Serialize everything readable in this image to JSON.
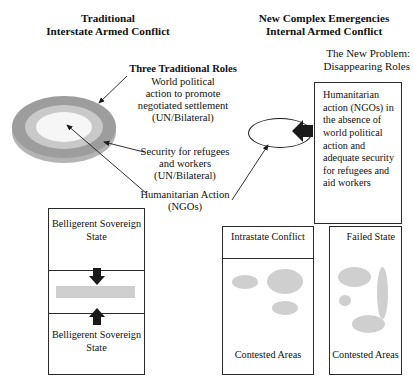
{
  "diagram": {
    "headings": {
      "left": "Traditional\nInterstate Armed Conflict",
      "right": "New Complex Emergencies\nInternal Armed Conflict",
      "right_sub": "The New Problem:\nDisappearing Roles"
    },
    "roles": {
      "title": "Three Traditional Roles",
      "role_1": "World political\naction to promote\nnegotiated settlement\n(UN/Bilateral)",
      "role_2": "Security for refugees\nand workers\n(UN/Bilateral)",
      "role_3": "Humanitarian Action\n(NGOs)"
    },
    "new_problem_box": {
      "text": "Humanitarian action (NGOs) in the absence of world political action and adequate security for refugees and aid workers"
    },
    "belligerent_box": {
      "top_label": "Belligerent\nSovereign\nState",
      "bottom_label": "Belligerent\nSovereign\nState",
      "arrow_down": "⬇",
      "arrow_up": "⬆"
    },
    "intrastate_box": {
      "title": "Intrastate\nConflict",
      "caption": "Contested\nAreas"
    },
    "failed_state_box": {
      "title": "Failed\nState",
      "caption": "Contested\nAreas"
    },
    "colors": {
      "ring_outer": "#9d9d9d",
      "ring_mid": "#c9c9c9",
      "ring_inner": "#f6f6f6",
      "blob": "#cfcfcf",
      "front_bar": "#cfcfcf",
      "stroke": "#2a2a2a",
      "background": "#ffffff"
    }
  }
}
